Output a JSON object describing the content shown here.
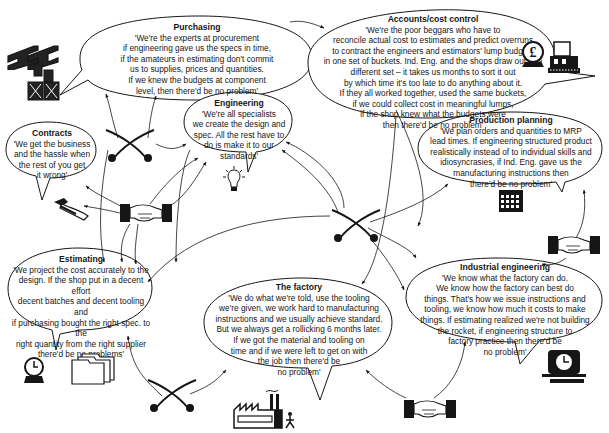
{
  "diagram": {
    "type": "organizational blame-culture diagram",
    "bubbles": [
      {
        "id": "purchasing",
        "title": "Purchasing",
        "quote": "'We're the experts at procurement\nif engineering gave us the specs in time,\nif the amateurs in estimating don't commit\nus to supplies, prices and quantities.\nIf we knew the budgets at component\nlevel, then there'd be no problem'"
      },
      {
        "id": "accounts",
        "title": "Accounts/cost control",
        "quote": "'We're the poor beggars who have to\nreconcile actual cost to estimates and predict overruns\nto contract the engineers and estimators' lump budgets\nin one set of buckets. Ind. Eng. and the shops draw out of a\ndifferent set – it takes us months to sort it out\nby which time it's too late to do anything about it.\nIf they all worked together, used the same buckets,\nif we could collect cost in meaningful lumps,\nif the shop knew what the budgets were\nthen there'd be no problem'"
      },
      {
        "id": "engineering",
        "title": "Engineering",
        "quote": "'We're all specialists\nwe create the design and\nspec. All the rest have to\ndo is make it to our\nstandards'"
      },
      {
        "id": "contracts",
        "title": "Contracts",
        "quote": "'We get the business\nand the hassle when\nthe rest of you get\nit wrong'"
      },
      {
        "id": "production_planning",
        "title": "Production planning",
        "quote": "'We plan orders and quantities to MRP\nlead times. If engineering structured product\nrealistically instead of to individual skills and\nidiosyncrasies, if Ind. Eng. gave us the\nmanufacturing instructions then\nthere'd be no problem'"
      },
      {
        "id": "estimating",
        "title": "Estimating",
        "quote": "'We project the cost accurately to the\ndesign. If the shop put in a decent effort\ndecent batches and decent tooling and\nif purchasing bought the right spec. to the\nright quantity from the right supplier\nthere'd be no problems'"
      },
      {
        "id": "factory",
        "title": "The factory",
        "quote": "'We do what we're told, use the tooling\nwe're given, we work hard to manufacturing\ninstructions and we usually achieve standard.\nBut we always get a rollicking 6 months later.\nIf we got the material and tooling on\ntime and if we were left to get on with\nthe job then there'd be\nno problem'"
      },
      {
        "id": "industrial_engineering",
        "title": "Industrial engineering",
        "quote": "'We know what the factory can do.\nWe know how the factory can best do\nthings. That's how we issue instructions and\ntooling, we know how much it costs to make\nthings. If estimating realized we're not building\nthe rocket, if engineering structure to\nfactory practice then there'd be\nno problem'"
      }
    ],
    "icons": [
      {
        "id": "steel-beams",
        "near": "purchasing"
      },
      {
        "id": "stacked-crates",
        "near": "purchasing"
      },
      {
        "id": "pound-coin-globe",
        "near": "accounts",
        "glyph": "£"
      },
      {
        "id": "cash-register",
        "near": "accounts"
      },
      {
        "id": "light-bulb",
        "near": "engineering"
      },
      {
        "id": "hand-signing",
        "near": "contracts"
      },
      {
        "id": "calendar",
        "near": "production_planning"
      },
      {
        "id": "clock-globe",
        "near": "estimating"
      },
      {
        "id": "file-folders",
        "near": "estimating"
      },
      {
        "id": "factory-building",
        "near": "factory"
      },
      {
        "id": "time-clock",
        "near": "industrial_engineering"
      },
      {
        "id": "handshake",
        "count": 3
      },
      {
        "id": "crossed-swords",
        "count": 3
      }
    ],
    "colors": {
      "ink": "#161616",
      "background": "#ffffff"
    }
  }
}
